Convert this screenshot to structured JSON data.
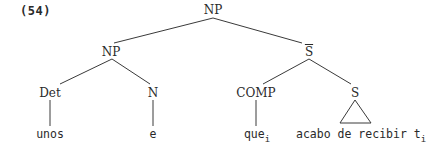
{
  "example": {
    "number": "(54)"
  },
  "tree": {
    "root": {
      "label": "NP",
      "children": [
        {
          "label": "NP",
          "children": [
            {
              "label": "Det",
              "leaf": "unos"
            },
            {
              "label": "N",
              "leaf": "e"
            }
          ]
        },
        {
          "label": "S",
          "bar": true,
          "children": [
            {
              "label": "COMP",
              "leaf": "que",
              "leaf_subscript": "i"
            },
            {
              "label": "S",
              "triangle": true,
              "leaf_words": [
                "acabo",
                "de",
                "recibir"
              ],
              "trace": "t",
              "trace_subscript": "i"
            }
          ]
        }
      ]
    }
  },
  "nodes": {
    "root_np": "NP",
    "left_np": "NP",
    "sbar": "S",
    "det": "Det",
    "n": "N",
    "comp": "COMP",
    "s": "S"
  },
  "leaves": {
    "unos": "unos",
    "e": "e",
    "que": "que",
    "que_sub": "i",
    "acabo": "acabo",
    "de": "de",
    "recibir": "recibir",
    "trace": "t",
    "trace_sub": "i"
  }
}
